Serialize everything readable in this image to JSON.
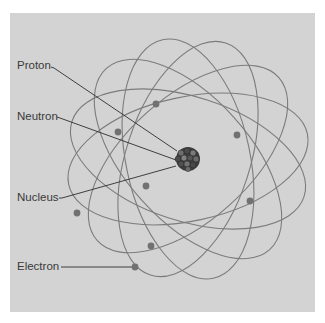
{
  "diagram": {
    "labels": {
      "proton": "Proton",
      "neutron": "Neutron",
      "nucleus": "Nucleus",
      "electron": "Electron"
    },
    "colors": {
      "background": "#d3d3d3",
      "orbit": "#7a7a7a",
      "electron": "#707070",
      "nucleus": "#3e3e3e",
      "leader": "#2a2a2a"
    },
    "orbit_count": 6,
    "electron_count": 8
  }
}
